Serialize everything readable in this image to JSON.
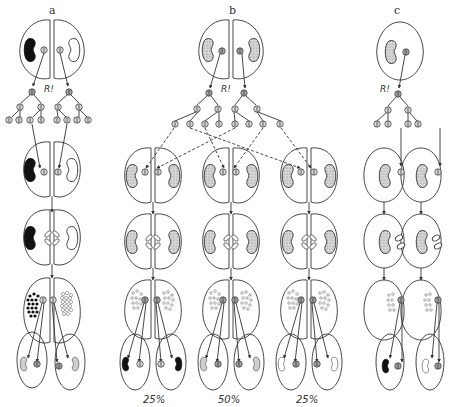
{
  "figure": {
    "panels": [
      {
        "id": "a",
        "label": "a",
        "label_x": 49,
        "label_y": 4,
        "r_label": "R!",
        "r_x": 48,
        "r_y": 88
      },
      {
        "id": "b",
        "label": "b",
        "label_x": 229,
        "label_y": 4,
        "r_label": "R!",
        "r_x": 221,
        "r_y": 88
      },
      {
        "id": "c",
        "label": "c",
        "label_x": 394,
        "label_y": 4,
        "r_label": "R!",
        "r_x": 370,
        "r_y": 88
      }
    ],
    "percentages": [
      {
        "label": "25%",
        "x": 141,
        "y": 393
      },
      {
        "label": "50%",
        "x": 218,
        "y": 393
      },
      {
        "label": "25%",
        "x": 296,
        "y": 393
      }
    ],
    "colors": {
      "stroke": "#333333",
      "macronucleus_black": "#111111",
      "macronucleus_stippled": "#c8c8c8",
      "background": "#ffffff"
    }
  }
}
